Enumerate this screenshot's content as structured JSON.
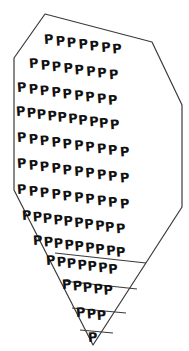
{
  "figure": {
    "letter": "P",
    "stroke_color": "#3a3a3a",
    "fill_color": "#ffffff",
    "glyph_color": "#111111",
    "background": "#ffffff",
    "canvas": {
      "width": 189,
      "height": 351
    },
    "outline_points": "45,14 152,42 182,105 182,207 93,345 14,190 14,58",
    "divider_lines": [
      {
        "name": "divider-1",
        "x1": 55,
        "y1": 253,
        "x2": 146,
        "y2": 263
      },
      {
        "name": "divider-2",
        "x1": 63,
        "y1": 281,
        "x2": 137,
        "y2": 289
      },
      {
        "name": "divider-3",
        "x1": 72,
        "y1": 308,
        "x2": 126,
        "y2": 313
      },
      {
        "name": "divider-4",
        "x1": 80,
        "y1": 330,
        "x2": 113,
        "y2": 333
      }
    ],
    "rows": [
      {
        "name": "glyph-row-1",
        "count": 7,
        "x": 44,
        "y": 28,
        "rot": 8,
        "gap": 2
      },
      {
        "name": "glyph-row-2",
        "count": 8,
        "x": 29,
        "y": 52,
        "rot": 8,
        "gap": 2
      },
      {
        "name": "glyph-row-3",
        "count": 9,
        "x": 17,
        "y": 76,
        "rot": 8,
        "gap": 2
      },
      {
        "name": "glyph-row-4",
        "count": 10,
        "x": 16,
        "y": 100,
        "rot": 8,
        "gap": 1
      },
      {
        "name": "glyph-row-5",
        "count": 10,
        "x": 17,
        "y": 126,
        "rot": 8,
        "gap": 2
      },
      {
        "name": "glyph-row-6",
        "count": 10,
        "x": 17,
        "y": 152,
        "rot": 8,
        "gap": 2
      },
      {
        "name": "glyph-row-7",
        "count": 10,
        "x": 17,
        "y": 178,
        "rot": 8,
        "gap": 2
      },
      {
        "name": "glyph-row-8",
        "count": 10,
        "x": 22,
        "y": 204,
        "rot": 8,
        "gap": 1
      },
      {
        "name": "glyph-row-9",
        "count": 9,
        "x": 33,
        "y": 229,
        "rot": 8,
        "gap": 1
      },
      {
        "name": "glyph-row-10",
        "count": 7,
        "x": 46,
        "y": 249,
        "rot": 8,
        "gap": 1
      },
      {
        "name": "glyph-row-11",
        "count": 5,
        "x": 62,
        "y": 273,
        "rot": 8,
        "gap": 1
      },
      {
        "name": "glyph-row-12",
        "count": 3,
        "x": 76,
        "y": 301,
        "rot": 8,
        "gap": 1
      },
      {
        "name": "glyph-row-13",
        "count": 1,
        "x": 88,
        "y": 326,
        "rot": 8,
        "gap": 1
      }
    ],
    "total_letters": 99
  }
}
